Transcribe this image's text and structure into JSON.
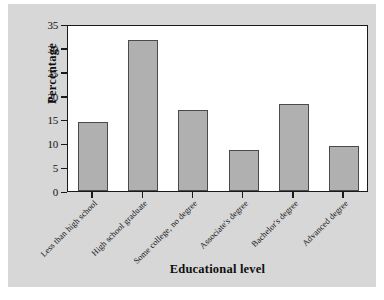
{
  "chart_data": {
    "type": "bar",
    "title": "",
    "xlabel": "Educational level",
    "ylabel": "Percentage",
    "categories": [
      "Less than high school",
      "High school graduate",
      "Some college, no degree",
      "Associate's degree",
      "Bachelor's degree",
      "Advanced degree"
    ],
    "values": [
      14.4,
      31.7,
      17.0,
      8.7,
      18.3,
      9.5
    ],
    "ylim": [
      0,
      35
    ],
    "yticks": [
      0,
      5,
      10,
      15,
      20,
      25,
      30,
      35
    ],
    "ytick_labels": [
      "0",
      "5",
      "10",
      "15",
      "20",
      "25",
      "30",
      "35"
    ],
    "grid": false,
    "legend": false,
    "bar_color": "#b0b0b0",
    "bar_edge_color": "#4a4a4a",
    "plot_background": "#ffffff",
    "figure_background": "#d7d7d7",
    "axis_color": "#1a1a1a"
  }
}
